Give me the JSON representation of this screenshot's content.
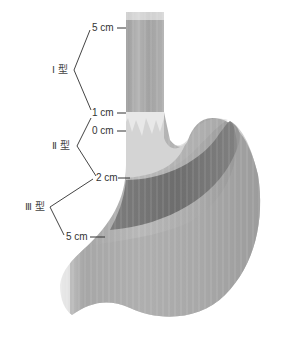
{
  "diagram": {
    "colors": {
      "line": "#333333",
      "text": "#333333",
      "esophagus": "#a9a9a9",
      "stomach": "#9a9a9a",
      "zone_dark": "#6e6e6e",
      "zone_light": "#d8d8d8"
    },
    "markers": [
      {
        "label": "5 cm",
        "position": "top"
      },
      {
        "label": "1 cm",
        "position": "upper"
      },
      {
        "label": "0 cm",
        "position": "junction"
      },
      {
        "label": "2 cm",
        "position": "lower"
      },
      {
        "label": "5 cm",
        "position": "bottom"
      }
    ],
    "types": [
      {
        "label": "Ⅰ 型",
        "range": "5 cm – 1 cm"
      },
      {
        "label": "Ⅱ 型",
        "range": "1 cm – 2 cm"
      },
      {
        "label": "Ⅲ 型",
        "range": "2 cm – 5 cm"
      }
    ]
  }
}
